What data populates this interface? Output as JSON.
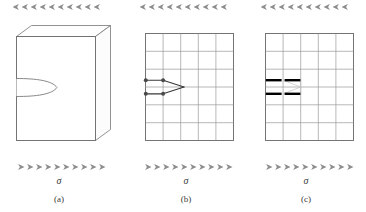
{
  "figure": {
    "panel_count": 3,
    "background_color": "#ffffff"
  },
  "style": {
    "arrow_color": "#8c8c8c",
    "outline_color": "#6e6e6e",
    "grid_line_color": "#9a9a9a",
    "grid_border_color": "#6e6e6e",
    "crack_line_color": "#3a3a3a",
    "node_fill_color": "#4a4a4a",
    "enriched_bar_color": "#000000",
    "text_color": "#3a3a3a",
    "load_arrow_count": 10
  },
  "panels": [
    {
      "id": "a",
      "caption": "(a)",
      "stress_label": "σ",
      "top_load_label": "σ",
      "geometry": "3d-block",
      "feature": "edge-crack-notch",
      "arrows_top": 10,
      "arrows_bottom": 10
    },
    {
      "id": "b",
      "caption": "(b)",
      "stress_label": "σ",
      "top_load_label": "σ",
      "geometry": "mesh-grid",
      "feature": "discrete-crack-nodes",
      "grid_columns": 5,
      "grid_rows": 6,
      "node_count": 4,
      "arrows_top": 10,
      "arrows_bottom": 10
    },
    {
      "id": "c",
      "caption": "(c)",
      "stress_label": "σ",
      "top_load_label": "σ",
      "geometry": "mesh-grid",
      "feature": "enriched-elements-bars",
      "grid_columns": 5,
      "grid_rows": 6,
      "enriched_bar_count": 4,
      "arrows_top": 10,
      "arrows_bottom": 10
    }
  ]
}
